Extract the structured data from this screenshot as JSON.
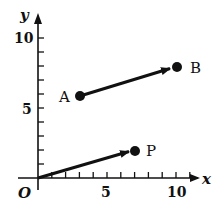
{
  "diagram": {
    "axes": {
      "x_label": "x",
      "y_label": "y",
      "origin_label": "O",
      "x_ticks": [
        "5",
        "10"
      ],
      "y_ticks": [
        "5",
        "10"
      ]
    },
    "points": [
      {
        "name": "A",
        "x": 3,
        "y": 6
      },
      {
        "name": "B",
        "x": 10,
        "y": 8
      },
      {
        "name": "P",
        "x": 7,
        "y": 2
      }
    ],
    "vectors": [
      {
        "from": "A",
        "to": "B"
      },
      {
        "from": "O",
        "to": "P"
      }
    ]
  }
}
